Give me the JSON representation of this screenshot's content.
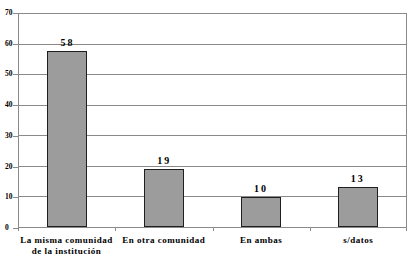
{
  "chart_data": {
    "type": "bar",
    "title": "",
    "xlabel": "",
    "ylabel": "",
    "categories": [
      "La misma comunidad\nde la institución",
      "En otra comunidad",
      "En ambas",
      "s/datos"
    ],
    "values": [
      58,
      19,
      10,
      13
    ],
    "data_labels": [
      "58",
      "19",
      "10",
      "13"
    ],
    "ylim": [
      0,
      70
    ],
    "yticks": [
      0,
      10,
      20,
      30,
      40,
      50,
      60,
      70
    ],
    "grid": true,
    "legend": false,
    "legend_position": "none",
    "colors": {
      "bar_fill": "#9c9c9c",
      "bar_border": "#1f1f1f",
      "grid": "#8a8a8a",
      "text": "#000000",
      "background": "#ffffff"
    }
  }
}
